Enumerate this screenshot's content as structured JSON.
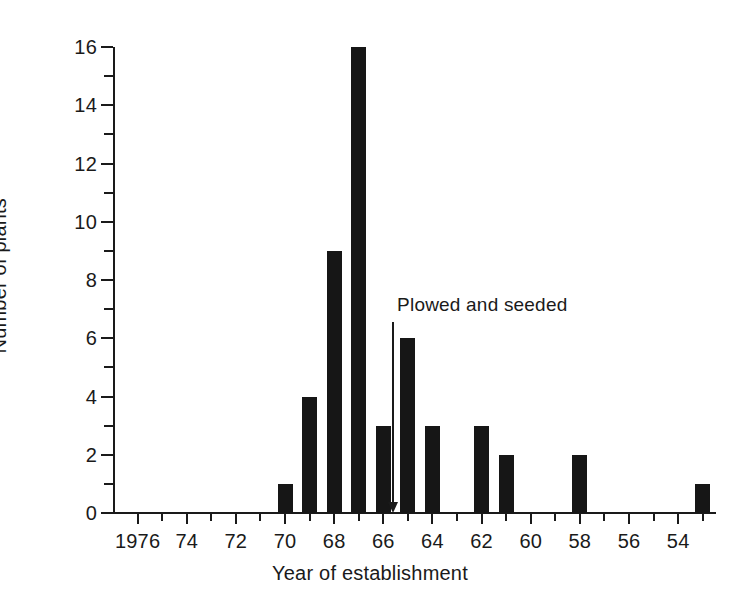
{
  "chart_data": {
    "type": "bar",
    "title": "",
    "subtitle": "",
    "xlabel": "Year of establishment",
    "ylabel": "Number of plants",
    "orientation": "vertical",
    "x_axis_direction": "descending",
    "grid": false,
    "legend": null,
    "xlim": [
      1977,
      1952.5
    ],
    "ylim": [
      0,
      16
    ],
    "y_tick_labels": [
      "0",
      "2",
      "4",
      "6",
      "8",
      "10",
      "12",
      "14",
      "16"
    ],
    "y_tick_values": [
      0,
      2,
      4,
      6,
      8,
      10,
      12,
      14,
      16
    ],
    "y_minor_tick_values": [
      1,
      3,
      5,
      7,
      9,
      11,
      13,
      15
    ],
    "x_tick_labels": [
      "1976",
      "74",
      "72",
      "70",
      "68",
      "66",
      "64",
      "62",
      "60",
      "58",
      "56",
      "54"
    ],
    "x_tick_values": [
      1976,
      1974,
      1972,
      1970,
      1968,
      1966,
      1964,
      1962,
      1960,
      1958,
      1956,
      1954
    ],
    "x_minor_tick_values": [
      1975,
      1973,
      1971,
      1969,
      1967,
      1965,
      1963,
      1961,
      1959,
      1957,
      1955,
      1953
    ],
    "categories": [
      1976,
      1975,
      1974,
      1973,
      1972,
      1971,
      1970,
      1969,
      1968,
      1967,
      1966,
      1965,
      1964,
      1963,
      1962,
      1961,
      1960,
      1959,
      1958,
      1957,
      1956,
      1955,
      1954,
      1953
    ],
    "values": [
      0,
      0,
      0,
      0,
      0,
      0,
      1,
      4,
      9,
      16,
      3,
      6,
      3,
      0,
      3,
      2,
      0,
      0,
      2,
      0,
      0,
      0,
      0,
      1
    ],
    "bars": [
      {
        "year": 1970,
        "value": 1
      },
      {
        "year": 1969,
        "value": 4
      },
      {
        "year": 1968,
        "value": 9
      },
      {
        "year": 1967,
        "value": 16
      },
      {
        "year": 1966,
        "value": 3
      },
      {
        "year": 1965,
        "value": 6
      },
      {
        "year": 1964,
        "value": 3
      },
      {
        "year": 1962,
        "value": 3
      },
      {
        "year": 1961,
        "value": 2
      },
      {
        "year": 1958,
        "value": 2
      },
      {
        "year": 1953,
        "value": 1
      }
    ],
    "annotations": [
      {
        "text": "Plowed and seeded",
        "x": 1965.6,
        "text_y": 7.1,
        "arrow_from_y": 6.55,
        "arrow_to_y": 0.0
      }
    ],
    "colors": {
      "bar": "#161616",
      "axis": "#1a1a1a",
      "background": "#ffffff",
      "text": "#1a1a1a"
    }
  }
}
